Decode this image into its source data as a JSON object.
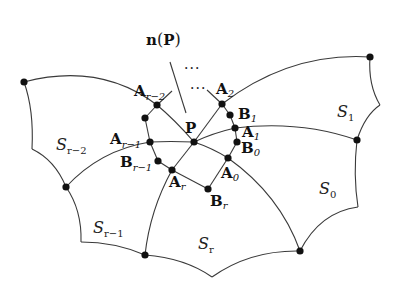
{
  "figure": {
    "normal_label": {
      "main": "n",
      "paren_open": "(",
      "arg": "P",
      "paren_close": ")"
    },
    "ellipsis_top": "···",
    "ellipsis_mid": "···",
    "center_point": {
      "main": "P"
    },
    "points": [
      {
        "id": "A_r-2",
        "main": "A",
        "sub": "r−2"
      },
      {
        "id": "A_r-1",
        "main": "A",
        "sub": "r−1"
      },
      {
        "id": "B_r-1",
        "main": "B",
        "sub": "r−1"
      },
      {
        "id": "A_r",
        "main": "A",
        "sub": "r"
      },
      {
        "id": "B_r",
        "main": "B",
        "sub": "r"
      },
      {
        "id": "A_0",
        "main": "A",
        "sub": "0"
      },
      {
        "id": "B_0",
        "main": "B",
        "sub": "0"
      },
      {
        "id": "A_1",
        "main": "A",
        "sub": "1"
      },
      {
        "id": "B_1",
        "main": "B",
        "sub": "1"
      },
      {
        "id": "A_2",
        "main": "A",
        "sub": "2"
      }
    ],
    "regions": [
      {
        "id": "S_r-2",
        "main": "S",
        "sub": "r−2"
      },
      {
        "id": "S_r-1",
        "main": "S",
        "sub": "r−1"
      },
      {
        "id": "S_r",
        "main": "S",
        "sub": "r"
      },
      {
        "id": "S_0",
        "main": "S",
        "sub": "0"
      },
      {
        "id": "S_1",
        "main": "S",
        "sub": "1"
      }
    ]
  }
}
